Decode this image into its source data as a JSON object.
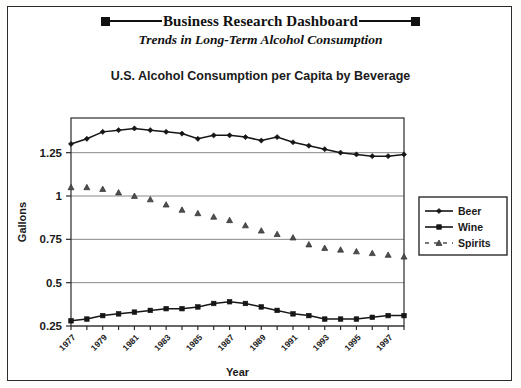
{
  "header": {
    "title": "Business Research Dashboard",
    "subtitle": "Trends in Long-Term Alcohol Consumption",
    "ornament_left": "filled-square",
    "ornament_right": "filled-square"
  },
  "chart_data": {
    "type": "line",
    "title": "U.S. Alcohol Consumption per Capita by Beverage",
    "xlabel": "Year",
    "ylabel": "Gallons",
    "ylim": [
      0.25,
      1.45
    ],
    "yticks": [
      "0.25",
      "0.5",
      "0.75",
      "1",
      "1.25"
    ],
    "ytick_values": [
      0.25,
      0.5,
      0.75,
      1,
      1.25
    ],
    "grid": true,
    "legend_position": "right",
    "x": [
      1977,
      1978,
      1979,
      1980,
      1981,
      1982,
      1983,
      1984,
      1985,
      1986,
      1987,
      1988,
      1989,
      1990,
      1991,
      1992,
      1993,
      1994,
      1995,
      1996,
      1997,
      1998
    ],
    "xtick_labels": [
      "1977",
      "1979",
      "1981",
      "1983",
      "1985",
      "1987",
      "1989",
      "1991",
      "1993",
      "1995",
      "1997"
    ],
    "xtick_values": [
      1977,
      1979,
      1981,
      1983,
      1985,
      1987,
      1989,
      1991,
      1993,
      1995,
      1997
    ],
    "series": [
      {
        "name": "Beer",
        "marker": "diamond",
        "line": "solid",
        "color": "#161616",
        "values": [
          1.3,
          1.33,
          1.37,
          1.38,
          1.39,
          1.38,
          1.37,
          1.36,
          1.33,
          1.35,
          1.35,
          1.34,
          1.32,
          1.34,
          1.31,
          1.29,
          1.27,
          1.25,
          1.24,
          1.23,
          1.23,
          1.24
        ]
      },
      {
        "name": "Wine",
        "marker": "square",
        "line": "solid",
        "color": "#161616",
        "values": [
          0.28,
          0.29,
          0.31,
          0.32,
          0.33,
          0.34,
          0.35,
          0.35,
          0.36,
          0.38,
          0.39,
          0.38,
          0.36,
          0.34,
          0.32,
          0.31,
          0.29,
          0.29,
          0.29,
          0.3,
          0.31,
          0.31
        ]
      },
      {
        "name": "Spirits",
        "marker": "triangle",
        "line": "dashed",
        "color": "#4f4f4f",
        "values": [
          1.05,
          1.05,
          1.04,
          1.02,
          1.0,
          0.98,
          0.95,
          0.92,
          0.9,
          0.88,
          0.86,
          0.83,
          0.8,
          0.78,
          0.76,
          0.72,
          0.7,
          0.69,
          0.68,
          0.67,
          0.66,
          0.65
        ]
      }
    ]
  }
}
